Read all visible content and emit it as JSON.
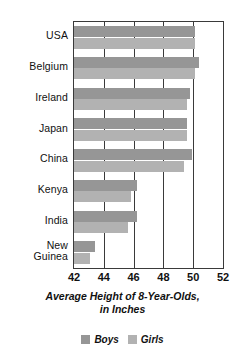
{
  "chart_data": {
    "type": "bar",
    "orientation": "horizontal",
    "title": "Average Height of 8-Year-Olds,",
    "title_line2": "in Inches",
    "xlabel": "",
    "ylabel": "",
    "xlim": [
      42,
      52
    ],
    "xticks": [
      42,
      44,
      46,
      48,
      50,
      52
    ],
    "xtick_labels": [
      "42",
      "44",
      "46",
      "48",
      "50",
      "52"
    ],
    "grid": true,
    "legend_position": "bottom",
    "categories": [
      "USA",
      "Belgium",
      "Ireland",
      "Japan",
      "China",
      "Kenya",
      "India",
      "New Guinea"
    ],
    "category_labels": [
      {
        "line1": "USA",
        "line2": ""
      },
      {
        "line1": "Belgium",
        "line2": ""
      },
      {
        "line1": "Ireland",
        "line2": ""
      },
      {
        "line1": "Japan",
        "line2": ""
      },
      {
        "line1": "China",
        "line2": ""
      },
      {
        "line1": "Kenya",
        "line2": ""
      },
      {
        "line1": "India",
        "line2": ""
      },
      {
        "line1": "New",
        "line2": "Guinea"
      }
    ],
    "series": [
      {
        "name": "Boys",
        "color": "#969696",
        "values": [
          50.1,
          50.4,
          49.8,
          49.6,
          49.9,
          46.2,
          46.2,
          43.4
        ]
      },
      {
        "name": "Girls",
        "color": "#b2b2b2",
        "values": [
          50.1,
          50.1,
          49.6,
          49.6,
          49.4,
          45.8,
          45.6,
          43.1
        ]
      }
    ]
  },
  "legend": {
    "items": [
      {
        "label": "Boys",
        "color": "#969696"
      },
      {
        "label": "Girls",
        "color": "#b2b2b2"
      }
    ]
  },
  "colors": {
    "boys": "#969696",
    "girls": "#b2b2b2",
    "axis": "#3a3a3a",
    "text": "#111111",
    "background": "#ffffff"
  }
}
